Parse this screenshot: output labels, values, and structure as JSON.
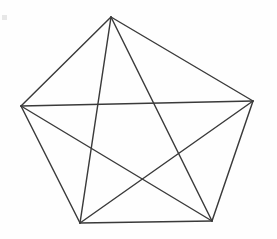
{
  "figure": {
    "background_color": "#fefefe",
    "line_color": "#3a3a3a",
    "line_width": 1.45,
    "width": 277,
    "height": 239
  },
  "chart_data": {
    "type": "diagram",
    "subtype": "node-link-graph",
    "xlabel": "",
    "ylabel": "",
    "grid": false,
    "legend": "none",
    "xlim": [
      0,
      277
    ],
    "ylim": [
      0,
      239
    ],
    "node_count": 5,
    "edge_count": 10,
    "nodes": [
      {
        "id": "A",
        "label": "",
        "x": 111,
        "y": 17
      },
      {
        "id": "B",
        "label": "",
        "x": 253,
        "y": 101
      },
      {
        "id": "C",
        "label": "",
        "x": 212,
        "y": 221
      },
      {
        "id": "D",
        "label": "",
        "x": 80,
        "y": 223
      },
      {
        "id": "E",
        "label": "",
        "x": 21,
        "y": 106
      }
    ],
    "edges": [
      {
        "id": "edge-A-B",
        "from": "A",
        "to": "B",
        "kind": "side"
      },
      {
        "id": "edge-B-C",
        "from": "B",
        "to": "C",
        "kind": "side"
      },
      {
        "id": "edge-C-D",
        "from": "C",
        "to": "D",
        "kind": "side"
      },
      {
        "id": "edge-D-E",
        "from": "D",
        "to": "E",
        "kind": "side"
      },
      {
        "id": "edge-E-A",
        "from": "E",
        "to": "A",
        "kind": "side"
      },
      {
        "id": "edge-A-C",
        "from": "A",
        "to": "C",
        "kind": "diagonal"
      },
      {
        "id": "edge-A-D",
        "from": "A",
        "to": "D",
        "kind": "diagonal"
      },
      {
        "id": "edge-B-D",
        "from": "B",
        "to": "D",
        "kind": "diagonal"
      },
      {
        "id": "edge-B-E",
        "from": "B",
        "to": "E",
        "kind": "diagonal"
      },
      {
        "id": "edge-C-E",
        "from": "C",
        "to": "E",
        "kind": "diagonal"
      }
    ],
    "artifacts": [
      {
        "id": "scan-speck",
        "x": 2,
        "y": 15,
        "width": 5,
        "height": 5
      }
    ]
  }
}
